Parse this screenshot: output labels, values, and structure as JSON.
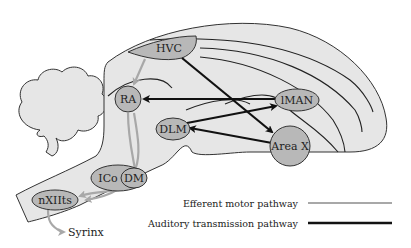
{
  "diagram": {
    "type": "neural-pathway-diagram",
    "nuclei": {
      "hvc": "HVC",
      "ra": "RA",
      "lman": "lMAN",
      "dlm": "DLM",
      "area_x": "Area X",
      "ico": "ICo",
      "dm": "DM",
      "nxiits": "nXIIts"
    },
    "output_label": "Syrinx",
    "connections": [
      {
        "from": "HVC",
        "to": "RA",
        "pathway": "motor"
      },
      {
        "from": "RA",
        "to": "DM",
        "pathway": "motor"
      },
      {
        "from": "RA",
        "to": "nXIIts",
        "pathway": "motor"
      },
      {
        "from": "DM",
        "to": "nXIIts",
        "pathway": "motor"
      },
      {
        "from": "nXIIts",
        "to": "Syrinx",
        "pathway": "motor"
      },
      {
        "from": "HVC",
        "to": "Area X",
        "pathway": "auditory"
      },
      {
        "from": "Area X",
        "to": "DLM",
        "pathway": "auditory"
      },
      {
        "from": "DLM",
        "to": "lMAN",
        "pathway": "auditory"
      },
      {
        "from": "lMAN",
        "to": "RA",
        "pathway": "auditory"
      }
    ],
    "legend": [
      {
        "label": "Efferent motor pathway",
        "color": "#a8a8a8"
      },
      {
        "label": "Auditory transmission pathway",
        "color": "#111111"
      }
    ],
    "colors": {
      "brain_fill": "#e6e6e6",
      "nucleus_fill": "#b8b8b8",
      "motor": "#a8a8a8",
      "auditory": "#111111"
    }
  }
}
